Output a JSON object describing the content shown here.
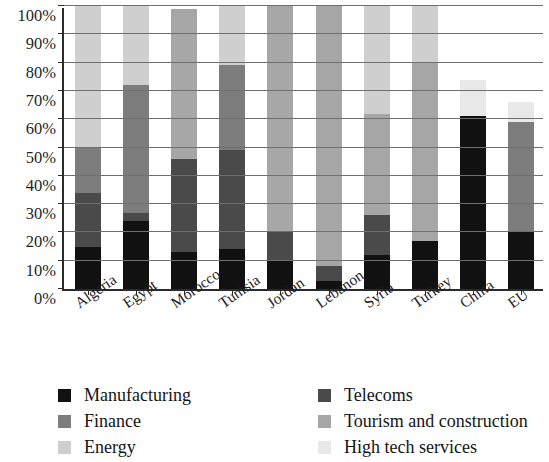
{
  "chart_data": {
    "type": "bar",
    "subtype": "stacked-bar-100",
    "title": "",
    "xlabel": "",
    "ylabel": "",
    "ylim": [
      0,
      100
    ],
    "ytick_labels": [
      "0%",
      "10%",
      "20%",
      "30%",
      "40%",
      "50%",
      "60%",
      "70%",
      "80%",
      "90%",
      "100%"
    ],
    "ytick_values": [
      0,
      10,
      20,
      30,
      40,
      50,
      60,
      70,
      80,
      90,
      100
    ],
    "grid": true,
    "legend_position": "bottom",
    "categories": [
      "Algeria",
      "Egypt",
      "Morocco",
      "Tunisia",
      "Jordan",
      "Lebanon",
      "Syria",
      "Turkey",
      "China",
      "EU"
    ],
    "series": [
      {
        "name": "Manufacturing",
        "color": "#111111",
        "values": [
          15,
          24,
          13,
          14,
          10,
          3,
          12,
          17,
          61,
          20
        ]
      },
      {
        "name": "Telecoms",
        "color": "#4a4a4a",
        "values": [
          19,
          3,
          33,
          35,
          10,
          5,
          14,
          0,
          0,
          0
        ]
      },
      {
        "name": "Finance",
        "color": "#7d7d7d",
        "values": [
          16,
          45,
          0,
          30,
          0,
          0,
          0,
          0,
          0,
          39
        ]
      },
      {
        "name": "Tourism and construction",
        "color": "#a6a6a6",
        "values": [
          0,
          0,
          53,
          0,
          80,
          92,
          36,
          63,
          0,
          0
        ]
      },
      {
        "name": "Energy",
        "color": "#cfcfcf",
        "values": [
          50,
          28,
          0,
          21,
          0,
          0,
          38,
          20,
          0,
          0
        ]
      },
      {
        "name": "High tech services",
        "color": "#e8e8e8",
        "values": [
          0,
          0,
          0,
          0,
          0,
          0,
          0,
          0,
          13,
          7
        ]
      }
    ],
    "totals": [
      100,
      100,
      99,
      100,
      100,
      100,
      100,
      100,
      74,
      66
    ]
  },
  "legend": {
    "items": [
      {
        "label": "Manufacturing",
        "color": "#111111"
      },
      {
        "label": "Finance",
        "color": "#7d7d7d"
      },
      {
        "label": "Energy",
        "color": "#cfcfcf"
      },
      {
        "label": "Telecoms",
        "color": "#4a4a4a"
      },
      {
        "label": "Tourism and construction",
        "color": "#a6a6a6"
      },
      {
        "label": "High tech services",
        "color": "#e8e8e8"
      }
    ]
  }
}
